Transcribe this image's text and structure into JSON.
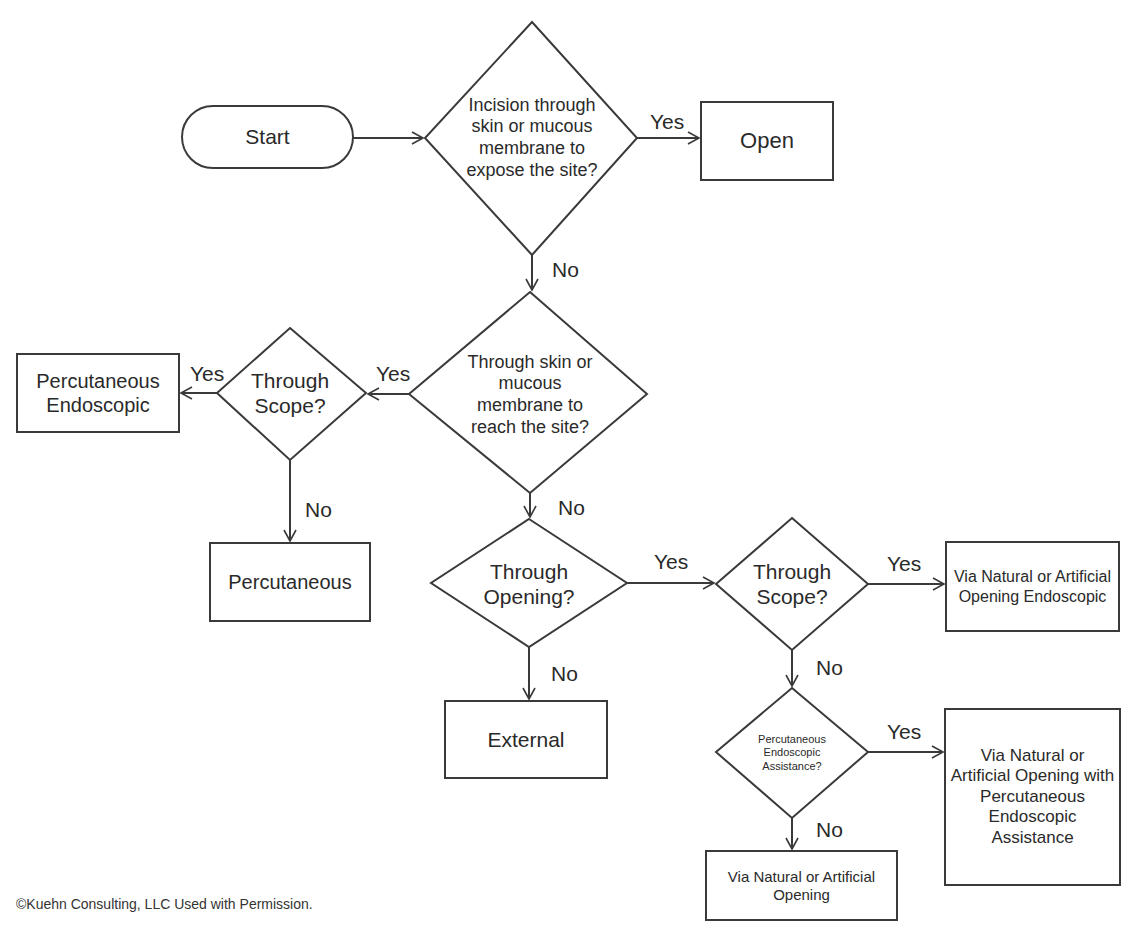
{
  "figure": {
    "title_partial": "Figure Approach",
    "copyright": "©Kuehn Consulting, LLC  Used with Permission."
  },
  "nodes": {
    "start": "Start",
    "q_incision": "Incision through skin or mucous membrane to expose the site?",
    "open": "Open",
    "q_reach": "Through skin or mucous membrane to reach the site?",
    "q_scope_left": "Through Scope?",
    "perc_endo": "Percutaneous Endoscopic",
    "percutaneous": "Percutaneous",
    "q_opening": "Through Opening?",
    "external": "External",
    "q_scope_right": "Through Scope?",
    "via_endo": "Via Natural or Artificial Opening Endoscopic",
    "q_assist": "Percutaneous Endoscopic Assistance?",
    "via_assist": "Via Natural or Artificial Opening with Percutaneous Endoscopic Assistance",
    "via_natural": "Via Natural or Artificial Opening"
  },
  "edge_labels": {
    "incision_yes": "Yes",
    "incision_no": "No",
    "reach_yes": "Yes",
    "reach_no": "No",
    "scope_left_yes": "Yes",
    "scope_left_no": "No",
    "opening_yes": "Yes",
    "opening_no": "No",
    "scope_right_yes": "Yes",
    "scope_right_no": "No",
    "assist_yes": "Yes",
    "assist_no": "No"
  },
  "colors": {
    "stroke": "#3a3a3a",
    "text": "#2a2a2a",
    "background": "#ffffff"
  }
}
